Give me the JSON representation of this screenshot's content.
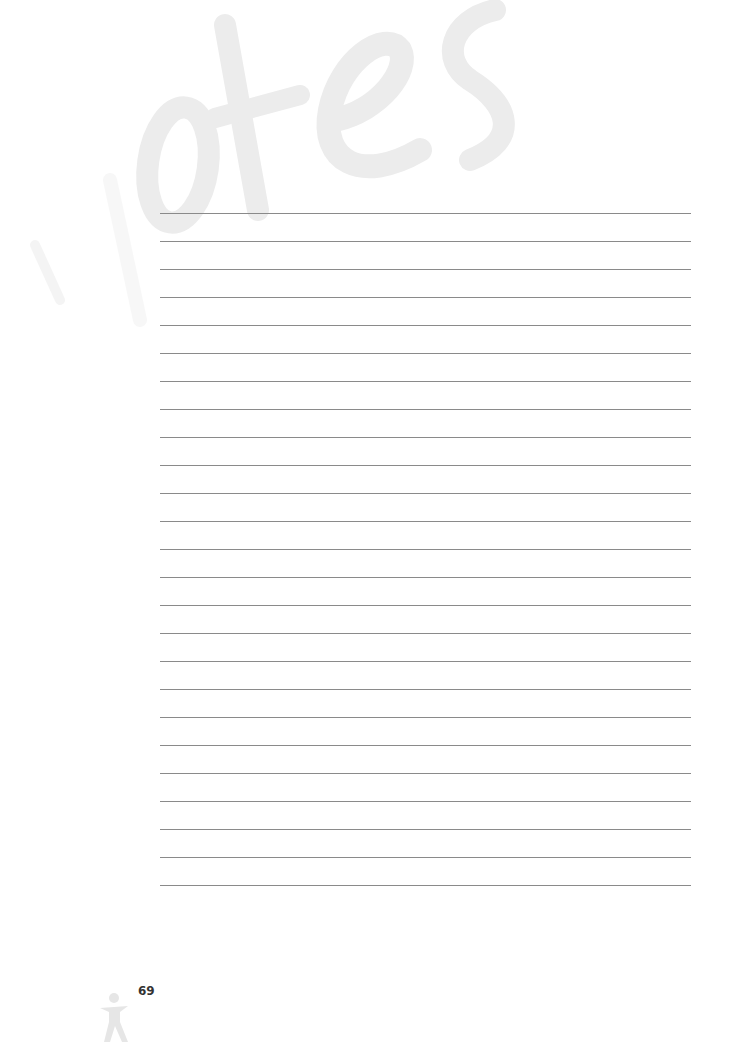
{
  "page": {
    "watermark_text": "Notes",
    "page_number": "69",
    "line_count": 25,
    "line_color": "#8a8a8a",
    "watermark_color": "#ececec",
    "icon": "person-figure-icon"
  }
}
